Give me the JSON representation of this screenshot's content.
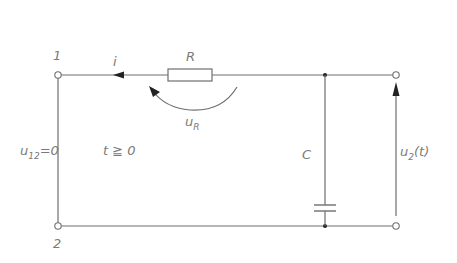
{
  "diagram": {
    "type": "RC circuit",
    "terminals": {
      "t1_label": "1",
      "t2_label": "2"
    },
    "components": {
      "resistor_label": "R",
      "capacitor_label": "C"
    },
    "annotations": {
      "current_label": "i",
      "resistor_voltage_main": "u",
      "resistor_voltage_sub": "R",
      "input_voltage_main": "u",
      "input_voltage_sub": "12",
      "input_voltage_value": "=0",
      "time_condition": "t ≧ 0",
      "output_voltage_main": "u",
      "output_voltage_sub": "2",
      "output_voltage_arg": "(t)"
    },
    "colors": {
      "line": "#6e6e6e",
      "text": "#7a7a7a",
      "background": "#ffffff"
    }
  }
}
